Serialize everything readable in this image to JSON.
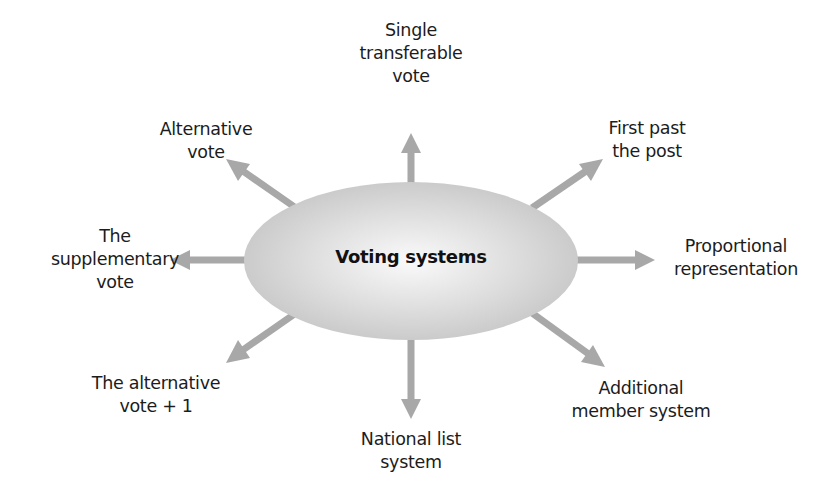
{
  "diagram": {
    "type": "hub-and-spoke",
    "center": {
      "label": "Voting systems"
    },
    "colors": {
      "arrow": "#a8a8a8",
      "ellipse_center": "#f7f7f7",
      "ellipse_edge": "#c4c4c4",
      "text": "#1c1c1c",
      "background": "#ffffff"
    },
    "branches": [
      {
        "id": "single-transferable-vote",
        "direction": "up",
        "label": "Single\ntransferable\nvote"
      },
      {
        "id": "first-past-the-post",
        "direction": "up-right",
        "label": "First past\nthe post"
      },
      {
        "id": "proportional-representation",
        "direction": "right",
        "label": "Proportional\nrepresentation"
      },
      {
        "id": "additional-member-system",
        "direction": "down-right",
        "label": "Additional\nmember system"
      },
      {
        "id": "national-list-system",
        "direction": "down",
        "label": "National list\nsystem"
      },
      {
        "id": "alternative-vote-plus-one",
        "direction": "down-left",
        "label": "The alternative\nvote + 1"
      },
      {
        "id": "supplementary-vote",
        "direction": "left",
        "label": "The\nsupplementary\nvote"
      },
      {
        "id": "alternative-vote",
        "direction": "up-left",
        "label": "Alternative\nvote"
      }
    ]
  }
}
